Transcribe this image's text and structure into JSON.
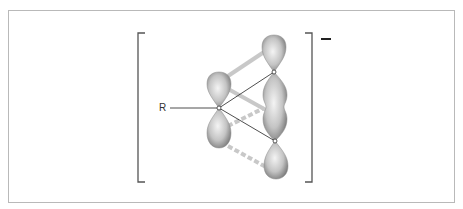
{
  "figure": {
    "substituent_label": "R",
    "charge_label": "−",
    "colors": {
      "frame": "#b9b9b9",
      "bracket": "#555555",
      "lobe_light": "#f2f2f2",
      "lobe_dark": "#8a8a8a",
      "overlap_band": "#c8c8c8",
      "bond_line": "#222222"
    },
    "atoms": [
      {
        "id": "central",
        "x": 219,
        "y": 108
      },
      {
        "id": "upper-right",
        "x": 274,
        "y": 72
      },
      {
        "id": "lower-right",
        "x": 275,
        "y": 141
      }
    ],
    "lobes": [
      {
        "id": "central-upper",
        "cx": 219,
        "cy": 90
      },
      {
        "id": "central-lower",
        "cx": 219,
        "cy": 130
      },
      {
        "id": "upper-right-top",
        "cx": 274,
        "cy": 52
      },
      {
        "id": "middle-merged",
        "cx": 275,
        "cy": 107
      },
      {
        "id": "lower-right-bottom",
        "cx": 276,
        "cy": 162
      }
    ],
    "interactions": [
      {
        "type": "solid-band",
        "from": "central-upper",
        "to": "upper-right-top"
      },
      {
        "type": "solid-band",
        "from": "central-upper",
        "to": "middle-merged"
      },
      {
        "type": "dashed-band",
        "from": "central-lower",
        "to": "middle-merged"
      },
      {
        "type": "dashed-band",
        "from": "central-lower",
        "to": "lower-right-bottom"
      }
    ]
  }
}
